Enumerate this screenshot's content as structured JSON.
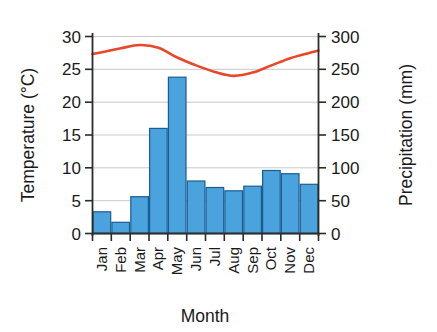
{
  "chart_data": {
    "type": "bar",
    "title": "",
    "subtitle": "",
    "xlabel": "Month",
    "ylabel": "Temperature (°C)",
    "y2label": "Precipitation (mm)",
    "categories": [
      "Jan",
      "Feb",
      "Mar",
      "Apr",
      "May",
      "Jun",
      "Jul",
      "Aug",
      "Sep",
      "Oct",
      "Nov",
      "Dec"
    ],
    "grid": true,
    "legend": "none",
    "ylim": [
      0,
      30
    ],
    "yticks": [
      "0",
      "5",
      "10",
      "15",
      "20",
      "25",
      "30"
    ],
    "y2lim": [
      0,
      300
    ],
    "y2ticks": [
      "0",
      "50",
      "100",
      "150",
      "200",
      "250",
      "300"
    ],
    "series": [
      {
        "name": "Precipitation",
        "kind": "bar",
        "axis": "right",
        "unit": "mm",
        "color": "#4aa3dd",
        "edge_color": "#1b5d93",
        "values": [
          33,
          17,
          56,
          160,
          238,
          80,
          70,
          65,
          72,
          96,
          91,
          75
        ]
      },
      {
        "name": "Temperature",
        "kind": "line",
        "axis": "left",
        "unit": "°C",
        "color": "#e8472a",
        "values": [
          27.6,
          28.2,
          28.7,
          28.3,
          26.8,
          25.6,
          24.6,
          24.0,
          24.5,
          25.6,
          26.7,
          27.5
        ]
      }
    ]
  },
  "colors": {
    "bar_fill": "#4aa3dd",
    "bar_edge": "#1b5d93",
    "line": "#e8472a",
    "grid": "#c9c9c9",
    "axis": "#2b2b2b",
    "background": "#ffffff"
  }
}
